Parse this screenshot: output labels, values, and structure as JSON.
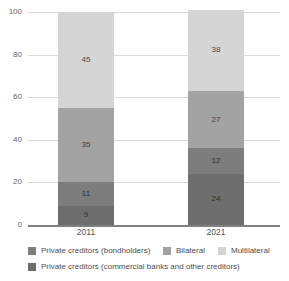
{
  "chart_data": {
    "type": "bar",
    "subtype": "stacked-bar",
    "title": "",
    "xlabel": "",
    "ylabel": "",
    "categories": [
      "2011",
      "2021"
    ],
    "ylim": [
      0,
      100
    ],
    "yticks": [
      "100",
      "80",
      "60",
      "40",
      "20",
      "0"
    ],
    "ytick_values": [
      100,
      80,
      60,
      40,
      20,
      0
    ],
    "grid": true,
    "legend_position": "bottom",
    "stack_order_bottom_to_top": [
      "Private creditors (commercial banks and other creditors)",
      "Private creditors (bondholders)",
      "Bilateral",
      "Multilateral"
    ],
    "series": [
      {
        "name": "Private creditors (commercial banks and other creditors)",
        "color": "#6e6e6e",
        "values": [
          9,
          24
        ]
      },
      {
        "name": "Private creditors (bondholders)",
        "color": "#7d7d7d",
        "values": [
          11,
          12
        ]
      },
      {
        "name": "Bilateral",
        "color": "#a3a3a3",
        "values": [
          35,
          27
        ]
      },
      {
        "name": "Multilateral",
        "color": "#d5d5d5",
        "values": [
          45,
          38
        ]
      }
    ],
    "bar_labels": {
      "2011": {
        "commercial_banks": "9",
        "bondholders": "11",
        "bilateral": "35",
        "multilateral": "45"
      },
      "2021": {
        "commercial_banks": "24",
        "bondholders": "12",
        "bilateral": "27",
        "multilateral": "38"
      }
    }
  },
  "axis": {
    "y_ticks": [
      {
        "label": "100",
        "value": 100
      },
      {
        "label": "80",
        "value": 80
      },
      {
        "label": "60",
        "value": 60
      },
      {
        "label": "40",
        "value": 40
      },
      {
        "label": "20",
        "value": 20
      },
      {
        "label": "0",
        "value": 0
      }
    ],
    "x_labels": [
      "2011",
      "2021"
    ]
  },
  "bars": [
    {
      "category": "2011",
      "segments": [
        {
          "label": "45",
          "value": 45,
          "series": "Multilateral",
          "color": "#d5d5d5",
          "tone": "light"
        },
        {
          "label": "35",
          "value": 35,
          "series": "Bilateral",
          "color": "#a3a3a3",
          "tone": "mid"
        },
        {
          "label": "11",
          "value": 11,
          "series": "Private creditors (bondholders)",
          "color": "#7d7d7d",
          "tone": "dark"
        },
        {
          "label": "9",
          "value": 9,
          "series": "Private creditors (commercial banks and other creditors)",
          "color": "#6e6e6e",
          "tone": "dark"
        }
      ]
    },
    {
      "category": "2021",
      "segments": [
        {
          "label": "38",
          "value": 38,
          "series": "Multilateral",
          "color": "#d5d5d5",
          "tone": "light"
        },
        {
          "label": "27",
          "value": 27,
          "series": "Bilateral",
          "color": "#a3a3a3",
          "tone": "mid"
        },
        {
          "label": "12",
          "value": 12,
          "series": "Private creditors (bondholders)",
          "color": "#7d7d7d",
          "tone": "dark"
        },
        {
          "label": "24",
          "value": 24,
          "series": "Private creditors (commercial banks and other creditors)",
          "color": "#6e6e6e",
          "tone": "dark"
        }
      ]
    }
  ],
  "legend": {
    "rows": [
      [
        {
          "label": "Private creditors (bondholders)",
          "color": "#7d7d7d",
          "left": 28
        },
        {
          "label": "Bilateral",
          "color": "#a3a3a3",
          "left": 163
        },
        {
          "label": "Multilateral",
          "color": "#d5d5d5",
          "left": 218
        }
      ],
      [
        {
          "label": "Private creditors (commercial banks and other creditors)",
          "color": "#6e6e6e",
          "left": 28
        }
      ]
    ]
  },
  "colors": {
    "multilateral": "#d5d5d5",
    "bilateral": "#a3a3a3",
    "bondholders": "#7d7d7d",
    "commercial_banks": "#6e6e6e",
    "gridline": "#d9d9d9",
    "axis_line": "#808080",
    "tick_text": "#666666",
    "label_text": "#4d4d4d",
    "background": "#ffffff"
  }
}
